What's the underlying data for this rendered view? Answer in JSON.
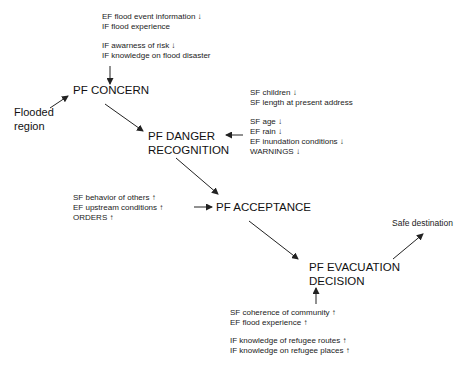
{
  "diagram": {
    "nodes": {
      "concern": "PF CONCERN",
      "danger_line1": "PF DANGER",
      "danger_line2": "RECOGNITION",
      "acceptance": "PF ACCEPTANCE",
      "evac_line1": "PF EVACUATION",
      "evac_line2": "DECISION"
    },
    "start": {
      "line1": "Flooded",
      "line2": "region"
    },
    "end": "Safe destination",
    "factors": {
      "concern_top_1": [
        "EF flood event information ↓",
        "IF flood experience"
      ],
      "concern_top_2": [
        "IF awarness of risk ↓",
        "IF knowledge on flood disaster"
      ],
      "danger_right_1": [
        "SF children ↓",
        "SF length at present address"
      ],
      "danger_right_2": [
        "SF age ↓",
        "EF rain ↓",
        "EF inundation conditions ↓",
        "WARNINGS ↓"
      ],
      "acceptance_left": [
        "SF behavior of others  ↑",
        "EF upstream conditions  ↑",
        "ORDERS ↑"
      ],
      "evac_bottom_1": [
        "SF coherence of community ↑",
        "EF flood experience ↑"
      ],
      "evac_bottom_2": [
        "IF knowledge of refugee routes  ↑",
        "IF knowledge on refugee places ↑"
      ]
    },
    "colors": {
      "line": "#222222",
      "text": "#111111",
      "background": "#ffffff"
    }
  }
}
